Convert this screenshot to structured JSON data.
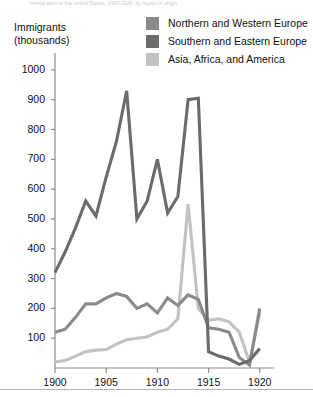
{
  "faint_header": "Immigration to the United States, 1900-1920, by region of origin",
  "axis_title_line1": "Immigrants",
  "axis_title_line2": "(thousands)",
  "colors": {
    "northern_western": "#8a8a8a",
    "southern_eastern": "#6b6b6b",
    "asia_africa_america": "#c2c2c2",
    "axis": "#8c8c8c",
    "text": "#111111"
  },
  "legend": {
    "items": [
      {
        "label": "Northern and Western Europe",
        "color": "#8a8a8a",
        "key": "northern_western"
      },
      {
        "label": "Southern and Eastern Europe",
        "color": "#6b6b6b",
        "key": "southern_eastern"
      },
      {
        "label": "Asia, Africa, and America",
        "color": "#c2c2c2",
        "key": "asia_africa_america"
      }
    ]
  },
  "chart_data": {
    "type": "line",
    "title": "Immigration to the United States, 1900-1920, by region of origin",
    "xlabel": "",
    "ylabel": "Immigrants (thousands)",
    "xlim": [
      1900,
      1921
    ],
    "ylim": [
      0,
      1050
    ],
    "grid": false,
    "legend_position": "top-right",
    "yticks": [
      100,
      200,
      300,
      400,
      500,
      600,
      700,
      800,
      900,
      1000
    ],
    "ytick_labels": [
      "100",
      "200",
      "300",
      "400",
      "500",
      "600",
      "700",
      "800",
      "900",
      "1000"
    ],
    "xticks": [
      1900,
      1905,
      1910,
      1915,
      1920
    ],
    "xtick_labels": [
      "1900",
      "1905",
      "1910",
      "1915",
      "1920"
    ],
    "x": [
      1900,
      1901,
      1902,
      1903,
      1904,
      1905,
      1906,
      1907,
      1908,
      1909,
      1910,
      1911,
      1912,
      1913,
      1914,
      1915,
      1916,
      1917,
      1918,
      1919,
      1920
    ],
    "series": [
      {
        "name": "Southern and Eastern Europe",
        "color": "#6b6b6b",
        "values": [
          320,
          390,
          470,
          560,
          510,
          640,
          760,
          930,
          500,
          560,
          700,
          520,
          575,
          900,
          905,
          55,
          40,
          30,
          12,
          25,
          65
        ]
      },
      {
        "name": "Northern and Western Europe",
        "color": "#8a8a8a",
        "values": [
          120,
          130,
          170,
          215,
          215,
          235,
          250,
          240,
          200,
          215,
          185,
          235,
          210,
          245,
          230,
          135,
          130,
          120,
          35,
          10,
          200
        ]
      },
      {
        "name": "Asia, Africa, and America",
        "color": "#c2c2c2",
        "values": [
          20,
          25,
          40,
          55,
          60,
          62,
          80,
          95,
          100,
          105,
          120,
          130,
          165,
          550,
          200,
          160,
          165,
          155,
          120,
          20,
          185
        ]
      }
    ]
  }
}
